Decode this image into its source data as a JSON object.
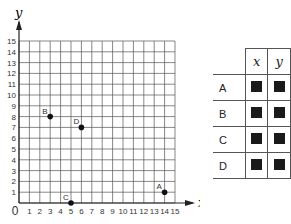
{
  "chart_data": {
    "type": "scatter",
    "title": "",
    "xlabel": "x",
    "ylabel": "y",
    "xlim": [
      0,
      15
    ],
    "ylim": [
      0,
      15
    ],
    "grid": true,
    "x_ticks": [
      "0",
      "1",
      "2",
      "3",
      "4",
      "5",
      "6",
      "7",
      "8",
      "9",
      "10",
      "11",
      "12",
      "13",
      "14",
      "15"
    ],
    "y_ticks": [
      "1",
      "2",
      "3",
      "4",
      "5",
      "6",
      "7",
      "8",
      "9",
      "10",
      "11",
      "12",
      "13",
      "14",
      "15"
    ],
    "points": [
      {
        "label": "A",
        "x": 14,
        "y": 1
      },
      {
        "label": "B",
        "x": 3,
        "y": 8
      },
      {
        "label": "C",
        "x": 5,
        "y": 0
      },
      {
        "label": "D",
        "x": 6,
        "y": 7
      }
    ]
  },
  "table": {
    "headers": [
      "x",
      "y"
    ],
    "rows": [
      {
        "label": "A"
      },
      {
        "label": "B"
      },
      {
        "label": "C"
      },
      {
        "label": "D"
      }
    ]
  }
}
